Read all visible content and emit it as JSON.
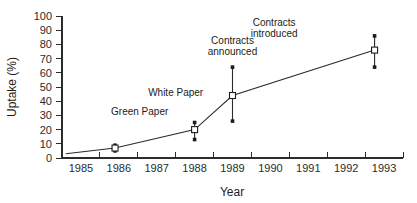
{
  "chart_data": {
    "type": "line",
    "title": "",
    "xlabel": "Year",
    "ylabel": "Uptake (%)",
    "xlim": [
      1984.5,
      1993.5
    ],
    "ylim": [
      0,
      100
    ],
    "grid": false,
    "legend": null,
    "y_ticks": [
      0,
      10,
      20,
      30,
      40,
      50,
      60,
      70,
      80,
      90,
      100
    ],
    "y_tick_labels": [
      "0",
      "10",
      "20",
      "30",
      "40",
      "50",
      "60",
      "70",
      "80",
      "90",
      "100"
    ],
    "x_ticks": [
      1985,
      1986,
      1987,
      1988,
      1989,
      1990,
      1991,
      1992,
      1993
    ],
    "x_tick_labels": [
      "1985",
      "1986",
      "1987",
      "1988",
      "1989",
      "1990",
      "1991",
      "1992",
      "1993"
    ],
    "series": [
      {
        "name": "Uptake",
        "marker": "open-square",
        "points": [
          {
            "x": 1984.6,
            "y": 3,
            "marker": false,
            "err_low": null,
            "err_high": null
          },
          {
            "x": 1985.9,
            "y": 7,
            "marker": true,
            "err_low": 5,
            "err_high": 9
          },
          {
            "x": 1988.0,
            "y": 20,
            "marker": true,
            "err_low": 13,
            "err_high": 25
          },
          {
            "x": 1989.0,
            "y": 44,
            "marker": true,
            "err_low": 26,
            "err_high": 64
          },
          {
            "x": 1992.75,
            "y": 76,
            "marker": true,
            "err_low": 64,
            "err_high": 86
          }
        ]
      }
    ],
    "annotations": [
      {
        "text_line1": "Green Paper",
        "text_line2": "",
        "x": 1986.55,
        "y": 30
      },
      {
        "text_line1": "White Paper",
        "text_line2": "",
        "x": 1987.5,
        "y": 44
      },
      {
        "text_line1": "Contracts",
        "text_line2": "announced",
        "x": 1989.0,
        "y": 80
      },
      {
        "text_line1": "Contracts",
        "text_line2": "introduced",
        "x": 1990.1,
        "y": 93
      }
    ]
  },
  "colors": {
    "ink": "#1c1c1c",
    "axis": "#2b2b2b",
    "background": "#ffffff",
    "marker_fill": "#ffffff"
  }
}
